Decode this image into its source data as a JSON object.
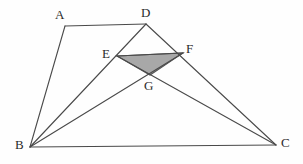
{
  "figure": {
    "type": "euclidean-geometry-diagram",
    "canvas": {
      "width": 303,
      "height": 164
    },
    "background_color": "#fefefe",
    "stroke_color": "#4a4a4a",
    "stroke_width": 1.1,
    "shaded_fill_color": "#a8a8a8",
    "shaded_stroke_color": "#555555",
    "points": [
      {
        "id": "A",
        "label": "A",
        "x": 65,
        "y": 26,
        "label_x": 55,
        "label_y": 8
      },
      {
        "id": "D",
        "label": "D",
        "x": 146,
        "y": 24,
        "label_x": 141,
        "label_y": 6
      },
      {
        "id": "E",
        "label": "E",
        "x": 117,
        "y": 56,
        "label_x": 102,
        "label_y": 47
      },
      {
        "id": "F",
        "label": "F",
        "x": 183,
        "y": 53,
        "label_x": 186,
        "label_y": 42
      },
      {
        "id": "G",
        "label": "G",
        "x": 150,
        "y": 75,
        "label_x": 144,
        "label_y": 79
      },
      {
        "id": "B",
        "label": "B",
        "x": 30,
        "y": 147,
        "label_x": 15,
        "label_y": 138
      },
      {
        "id": "C",
        "label": "C",
        "x": 276,
        "y": 145,
        "label_x": 281,
        "label_y": 136
      }
    ],
    "segments": [
      {
        "id": "AD",
        "name": "segment-ad",
        "from": "A",
        "to": "D"
      },
      {
        "id": "AB",
        "name": "segment-ab",
        "from": "A",
        "to": "B"
      },
      {
        "id": "BC",
        "name": "segment-bc",
        "from": "B",
        "to": "C"
      },
      {
        "id": "BD",
        "name": "segment-bd",
        "from": "B",
        "to": "D"
      },
      {
        "id": "DC",
        "name": "segment-dc",
        "from": "D",
        "to": "C"
      },
      {
        "id": "BF",
        "name": "segment-bf",
        "from": "B",
        "to": "F"
      },
      {
        "id": "EC",
        "name": "segment-ec",
        "from": "E",
        "to": "C"
      },
      {
        "id": "EF",
        "name": "segment-ef",
        "from": "E",
        "to": "F"
      }
    ],
    "shaded_region": {
      "id": "EFG",
      "name": "shaded-triangle-efg",
      "vertices": [
        "E",
        "F",
        "G"
      ]
    }
  }
}
